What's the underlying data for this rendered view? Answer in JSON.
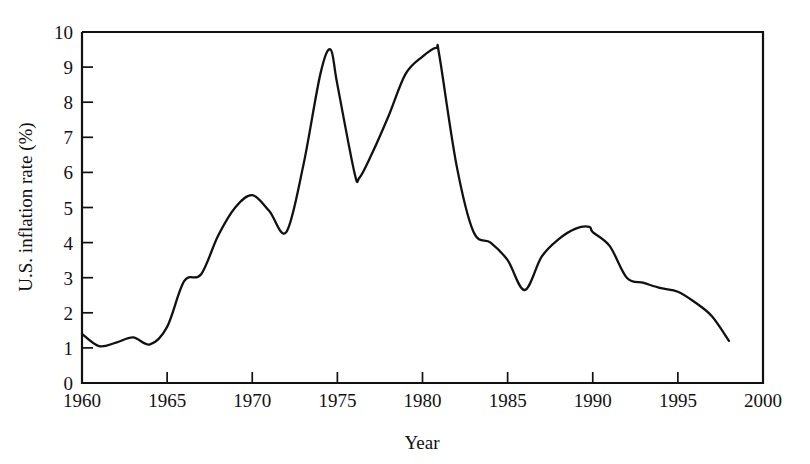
{
  "chart_data": {
    "type": "line",
    "title": "",
    "xlabel": "Year",
    "ylabel": "U.S. inflation rate (%)",
    "xlim": [
      1960,
      2000
    ],
    "ylim": [
      0,
      10
    ],
    "grid": false,
    "legend": null,
    "xticks": [
      1960,
      1965,
      1970,
      1975,
      1980,
      1985,
      1990,
      1995,
      2000
    ],
    "xtick_labels": [
      "1960",
      "1965",
      "1970",
      "1975",
      "1980",
      "1985",
      "1990",
      "1995",
      "2000"
    ],
    "yticks": [
      0,
      1,
      2,
      3,
      4,
      5,
      6,
      7,
      8,
      9,
      10
    ],
    "ytick_labels": [
      "0",
      "1",
      "2",
      "3",
      "4",
      "5",
      "6",
      "7",
      "8",
      "9",
      "10"
    ],
    "series": [
      {
        "name": "U.S. inflation rate",
        "color": "#111111",
        "x": [
          1960,
          1961,
          1962,
          1963,
          1964,
          1965,
          1966,
          1967,
          1968,
          1969,
          1970,
          1971,
          1972,
          1973,
          1974,
          1974.6,
          1975,
          1976,
          1976.3,
          1977,
          1978,
          1979,
          1980,
          1980.8,
          1981,
          1982,
          1983,
          1984,
          1985,
          1986,
          1987,
          1988,
          1989,
          1989.8,
          1990,
          1991,
          1992,
          1993,
          1994,
          1995,
          1996,
          1997,
          1998
        ],
        "values": [
          1.4,
          1.05,
          1.15,
          1.3,
          1.1,
          1.6,
          2.9,
          3.1,
          4.2,
          5.0,
          5.35,
          4.9,
          4.3,
          6.2,
          8.8,
          9.5,
          8.5,
          6.0,
          5.85,
          6.5,
          7.6,
          8.8,
          9.3,
          9.55,
          9.3,
          6.2,
          4.3,
          4.0,
          3.5,
          2.65,
          3.6,
          4.1,
          4.4,
          4.45,
          4.3,
          3.9,
          3.0,
          2.85,
          2.7,
          2.6,
          2.3,
          1.9,
          1.2
        ]
      }
    ]
  },
  "axes": {
    "y_axis_title": "U.S. inflation rate (%)",
    "x_axis_title": "Year"
  }
}
